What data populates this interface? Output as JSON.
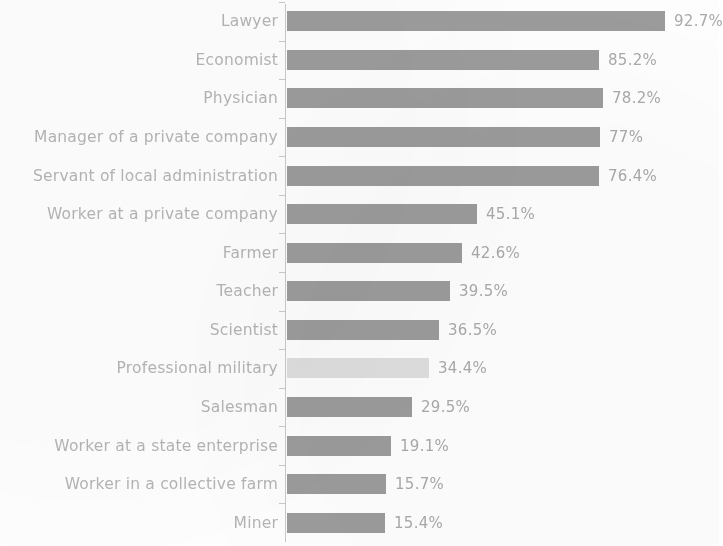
{
  "chart_data": {
    "type": "bar",
    "orientation": "horizontal",
    "title": "",
    "subtitle": "",
    "xlabel": "",
    "ylabel": "",
    "grid": false,
    "legend": null,
    "xlim": [
      0,
      100
    ],
    "value_suffix": "%",
    "categories": [
      "Lawyer",
      "Economist",
      "Physician",
      "Manager of a private company",
      "Servant of local administration",
      "Worker at a private company",
      "Farmer",
      "Teacher",
      "Scientist",
      "Professional military",
      "Salesman",
      "Worker at a state enterprise",
      "Worker in a collective farm",
      "Miner"
    ],
    "values": [
      92.7,
      85.2,
      78.2,
      77,
      76.4,
      45.1,
      42.6,
      39.5,
      36.5,
      34.4,
      29.5,
      19.1,
      15.7,
      15.4
    ],
    "value_labels": [
      "92.7%",
      "85.2%",
      "78.2%",
      "77%",
      "76.4%",
      "45.1%",
      "42.6%",
      "39.5%",
      "36.5%",
      "34.4%",
      "29.5%",
      "19.1%",
      "15.7%",
      "15.4%"
    ],
    "bar_pixel_lengths": [
      378,
      312,
      316,
      313,
      312,
      190,
      175,
      163,
      152,
      142,
      125,
      104,
      99,
      98
    ],
    "highlighted_index": 9,
    "colors": {
      "bar": "#9b9b9b",
      "bar_highlight": "#dedede",
      "category_label": "#b4b4b4",
      "value_label": "#a9a9a9",
      "axis": "#c9c9c9",
      "background": "#fdfdfd"
    }
  }
}
